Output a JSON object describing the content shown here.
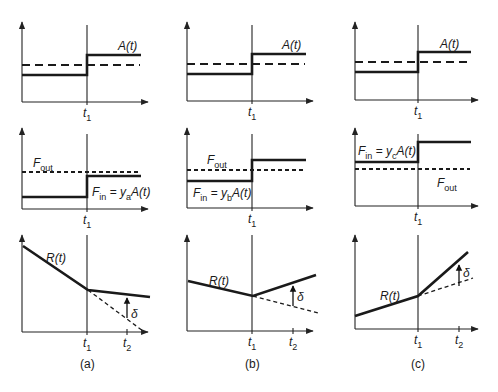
{
  "figure": {
    "columns": [
      {
        "id": "a",
        "caption": "(a)",
        "x0": 22,
        "t1x": 87,
        "xend": 148,
        "top": {
          "ytop": 22,
          "yaxis": 102,
          "low": 75,
          "high": 55,
          "dashed": 65,
          "label": "A(t)",
          "tick": "t",
          "tick_sub": "1",
          "label_x": 118,
          "label_y": 50
        },
        "mid": {
          "ytop": 128,
          "yaxis": 209,
          "low": 197,
          "high": 176,
          "dashed": 172,
          "fout": "F",
          "fout_sub": "out",
          "fout_x": 33,
          "fout_y": 167,
          "fin": "F",
          "fin_sub": "in",
          "fin_rest": " = y",
          "fin_rest_sub": "a",
          "fin_tail": "A(t)",
          "fin_x": 92,
          "fin_y": 196,
          "tick": "t",
          "tick_sub": "1"
        },
        "bot": {
          "ytop": 235,
          "yaxis": 332,
          "start": [
            23,
            246
          ],
          "kink": [
            88,
            290
          ],
          "end": [
            150,
            297
          ],
          "dash_end": [
            143,
            331
          ],
          "t2x": 127,
          "arrow_from": 318,
          "arrow_to": 296,
          "label": "R(t)",
          "label_x": 46,
          "label_y": 262,
          "delta": "δ",
          "delta_x": 131,
          "delta_y": 318,
          "t1": "t",
          "t1_sub": "1",
          "t2": "t",
          "t2_sub": "2"
        }
      },
      {
        "id": "b",
        "caption": "(b)",
        "x0": 187,
        "t1x": 252,
        "xend": 313,
        "top": {
          "ytop": 22,
          "yaxis": 101,
          "low": 74,
          "high": 54,
          "dashed": 64,
          "label": "A(t)",
          "tick": "t",
          "tick_sub": "1",
          "label_x": 282,
          "label_y": 49
        },
        "mid": {
          "ytop": 128,
          "yaxis": 208,
          "low": 181,
          "high": 160,
          "dashed": 170,
          "fout": "F",
          "fout_sub": "out",
          "fout_x": 207,
          "fout_y": 164,
          "fin": "F",
          "fin_sub": "in",
          "fin_rest": " = y",
          "fin_rest_sub": "b",
          "fin_tail": "A(t)",
          "fin_x": 193,
          "fin_y": 197,
          "tick": "t",
          "tick_sub": "1"
        },
        "bot": {
          "ytop": 235,
          "yaxis": 331,
          "start": [
            188,
            281
          ],
          "kink": [
            253,
            296
          ],
          "end": [
            316,
            275
          ],
          "dash_end": [
            318,
            313
          ],
          "t2x": 293,
          "arrow_from": 306,
          "arrow_to": 284,
          "label": "R(t)",
          "label_x": 209,
          "label_y": 285,
          "delta": "δ",
          "delta_x": 297,
          "delta_y": 301,
          "t1": "t",
          "t1_sub": "1",
          "t2": "t",
          "t2_sub": "2"
        }
      },
      {
        "id": "c",
        "caption": "(c)",
        "x0": 355,
        "t1x": 418,
        "xend": 478,
        "top": {
          "ytop": 22,
          "yaxis": 100,
          "low": 72,
          "high": 52,
          "dashed": 62,
          "label": "A(t)",
          "tick": "t",
          "tick_sub": "1",
          "label_x": 440,
          "label_y": 48
        },
        "mid": {
          "ytop": 128,
          "yaxis": 206,
          "low": 162,
          "high": 142,
          "dashed": 169,
          "fout": "F",
          "fout_sub": "out",
          "fout_x": 437,
          "fout_y": 187,
          "fin": "F",
          "fin_sub": "in",
          "fin_rest": " = y",
          "fin_rest_sub": "c",
          "fin_tail": "A(t)",
          "fin_x": 358,
          "fin_y": 155,
          "tick": "t",
          "tick_sub": "1"
        },
        "bot": {
          "ytop": 235,
          "yaxis": 329,
          "start": [
            355,
            316
          ],
          "kink": [
            418,
            296
          ],
          "end": [
            468,
            252
          ],
          "dash_end": [
            473,
            278
          ],
          "t2x": 459,
          "arrow_from": 286,
          "arrow_to": 263,
          "label": "R(t)",
          "label_x": 380,
          "label_y": 300,
          "delta": "δ",
          "delta_x": 463,
          "delta_y": 277,
          "t1": "t",
          "t1_sub": "1",
          "t2": "t",
          "t2_sub": "2"
        }
      }
    ]
  }
}
